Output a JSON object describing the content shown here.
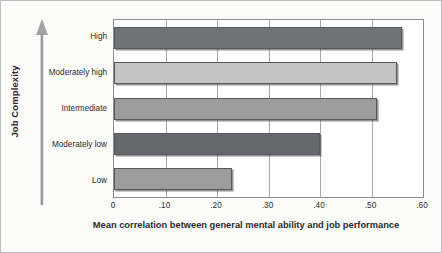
{
  "chart_data": {
    "type": "bar",
    "orientation": "horizontal",
    "title": "",
    "xlabel": "Mean correlation between general mental ability and job performance",
    "ylabel": "Job Complexity",
    "categories": [
      "High",
      "Moderately high",
      "Intermediate",
      "Moderately low",
      "Low"
    ],
    "values": [
      0.56,
      0.55,
      0.51,
      0.4,
      0.23
    ],
    "xlim": [
      0,
      0.6
    ],
    "xticks": [
      0,
      0.1,
      0.2,
      0.3,
      0.4,
      0.5,
      0.6
    ],
    "xtick_labels": [
      "0",
      ".10",
      ".20",
      ".30",
      ".40",
      ".50",
      ".60"
    ],
    "grid": "vertical",
    "legend": "none",
    "bar_colors": [
      "#6f7376",
      "#c3c4c3",
      "#9b9c9b",
      "#66696c",
      "#9b9c9b"
    ],
    "series": [
      {
        "name": "Mean correlation",
        "points": [
          {
            "category": "High",
            "value": 0.56
          },
          {
            "category": "Moderately high",
            "value": 0.55
          },
          {
            "category": "Intermediate",
            "value": 0.51
          },
          {
            "category": "Moderately low",
            "value": 0.4
          },
          {
            "category": "Low",
            "value": 0.23
          }
        ]
      }
    ]
  },
  "axis": {
    "y_title": "Job Complexity",
    "y_arrow_icon": "up-arrow-icon",
    "x_title": "Mean correlation between general mental ability and job performance"
  },
  "ticks": [
    {
      "label": "0",
      "value": 0
    },
    {
      "label": ".10",
      "value": 0.1
    },
    {
      "label": ".20",
      "value": 0.2
    },
    {
      "label": ".30",
      "value": 0.3
    },
    {
      "label": ".40",
      "value": 0.4
    },
    {
      "label": ".50",
      "value": 0.5
    },
    {
      "label": ".60",
      "value": 0.6
    }
  ],
  "colors": {
    "figure_background": "#fbfbfa",
    "plot_background": "#ffffff",
    "plot_border": "#8d8d8d",
    "gridline": "#a8a8a8",
    "text": "#2b2b2b",
    "bar_dark": "#6f7376",
    "bar_light": "#c3c4c3",
    "bar_medium": "#9b9c9b",
    "bar_outline": "#55585c",
    "arrow": "#9a9a9a"
  }
}
